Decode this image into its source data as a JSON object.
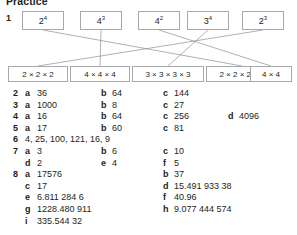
{
  "page": {
    "title": "Practice"
  },
  "question1": {
    "number": "1",
    "top_boxes": [
      {
        "base": "2",
        "exponent": "4"
      },
      {
        "base": "4",
        "exponent": "3"
      },
      {
        "base": "4",
        "exponent": "2"
      },
      {
        "base": "3",
        "exponent": "4"
      },
      {
        "base": "2",
        "exponent": "3"
      }
    ],
    "bottom_boxes": [
      {
        "text": "2 × 2 × 2"
      },
      {
        "text": "4 × 4 × 4"
      },
      {
        "text": "3 × 3 × 3 × 3"
      },
      {
        "text": "2 × 2 × 2 × 2"
      },
      {
        "text": "4 × 4"
      }
    ],
    "connections": [
      {
        "from": 0,
        "to": 3
      },
      {
        "from": 1,
        "to": 1
      },
      {
        "from": 2,
        "to": 4
      },
      {
        "from": 3,
        "to": 2
      },
      {
        "from": 4,
        "to": 0
      }
    ]
  },
  "answers": [
    {
      "number": "2",
      "items": [
        {
          "label": "a",
          "value": "36",
          "col": "A"
        },
        {
          "label": "b",
          "value": "64",
          "col": "B"
        },
        {
          "label": "c",
          "value": "144",
          "col": "C"
        }
      ]
    },
    {
      "number": "3",
      "items": [
        {
          "label": "a",
          "value": "1000",
          "col": "A"
        },
        {
          "label": "b",
          "value": "8",
          "col": "B"
        },
        {
          "label": "c",
          "value": "27",
          "col": "C"
        }
      ]
    },
    {
      "number": "4",
      "items": [
        {
          "label": "a",
          "value": "16",
          "col": "A"
        },
        {
          "label": "b",
          "value": "64",
          "col": "B"
        },
        {
          "label": "c",
          "value": "256",
          "col": "C"
        },
        {
          "label": "d",
          "value": "4096",
          "col": "D"
        }
      ]
    },
    {
      "number": "5",
      "items": [
        {
          "label": "a",
          "value": "17",
          "col": "A"
        },
        {
          "label": "b",
          "value": "60",
          "col": "B"
        },
        {
          "label": "c",
          "value": "81",
          "col": "C"
        }
      ]
    },
    {
      "number": "6",
      "plain": "4, 25, 100, 121, 16, 9"
    },
    {
      "number": "7",
      "items": [
        {
          "label": "a",
          "value": "3",
          "col": "A"
        },
        {
          "label": "b",
          "value": "6",
          "col": "B"
        },
        {
          "label": "c",
          "value": "10",
          "col": "C"
        }
      ]
    },
    {
      "number": "",
      "items": [
        {
          "label": "d",
          "value": "2",
          "col": "A"
        },
        {
          "label": "e",
          "value": "4",
          "col": "B"
        },
        {
          "label": "f",
          "value": "5",
          "col": "C"
        }
      ]
    },
    {
      "number": "8",
      "items": [
        {
          "label": "a",
          "value": "17576",
          "col": "A"
        },
        {
          "label": "b",
          "value": "37",
          "col": "C"
        }
      ]
    },
    {
      "number": "",
      "items": [
        {
          "label": "c",
          "value": "17",
          "col": "A"
        },
        {
          "label": "d",
          "value": "15.491 933 38",
          "col": "C"
        }
      ]
    },
    {
      "number": "",
      "items": [
        {
          "label": "e",
          "value": "6.811 284 6",
          "col": "A"
        },
        {
          "label": "f",
          "value": "40.96",
          "col": "C"
        }
      ]
    },
    {
      "number": "",
      "items": [
        {
          "label": "g",
          "value": "1228.480 911",
          "col": "A"
        },
        {
          "label": "h",
          "value": "9.077 444 574",
          "col": "C"
        }
      ]
    },
    {
      "number": "",
      "items": [
        {
          "label": "i",
          "value": "335.544 32",
          "col": "A"
        }
      ]
    }
  ],
  "colors": {
    "text": "#231f20",
    "box_border": "#a6a8ab",
    "wire": "#8d8f92",
    "background": "#ffffff"
  }
}
